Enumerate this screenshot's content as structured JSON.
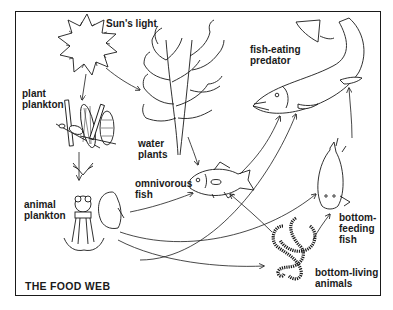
{
  "diagram": {
    "title": "THE FOOD WEB",
    "colors": {
      "ink": "#1a1a1a",
      "background": "#ffffff"
    },
    "nodes": [
      {
        "id": "sun",
        "label": "Sun's light",
        "icon": "sun-icon"
      },
      {
        "id": "plant_plankton",
        "label": "plant\nplankton",
        "icon": "plant-plankton-icon"
      },
      {
        "id": "water_plants",
        "label": "water\nplants",
        "icon": "water-plant-icon"
      },
      {
        "id": "animal_plankton",
        "label": "animal\nplankton",
        "icon": "animal-plankton-icon"
      },
      {
        "id": "omnivorous_fish",
        "label": "omnivorous\nfish",
        "icon": "omnivorous-fish-icon"
      },
      {
        "id": "predator",
        "label": "fish-eating\npredator",
        "icon": "pike-icon"
      },
      {
        "id": "bottom_fish",
        "label": "bottom-\nfeeding\nfish",
        "icon": "bottom-fish-icon"
      },
      {
        "id": "bottom_animals",
        "label": "bottom-living\nanimals",
        "icon": "worm-icon"
      }
    ],
    "edges": [
      {
        "from": "sun",
        "to": "plant_plankton"
      },
      {
        "from": "sun",
        "to": "water_plants"
      },
      {
        "from": "plant_plankton",
        "to": "animal_plankton"
      },
      {
        "from": "water_plants",
        "to": "omnivorous_fish"
      },
      {
        "from": "animal_plankton",
        "to": "omnivorous_fish"
      },
      {
        "from": "animal_plankton",
        "to": "bottom_fish"
      },
      {
        "from": "animal_plankton",
        "to": "bottom_animals"
      },
      {
        "from": "animal_plankton",
        "to": "predator"
      },
      {
        "from": "omnivorous_fish",
        "to": "predator"
      },
      {
        "from": "bottom_animals",
        "to": "omnivorous_fish"
      },
      {
        "from": "bottom_animals",
        "to": "bottom_fish"
      },
      {
        "from": "bottom_fish",
        "to": "predator"
      }
    ]
  }
}
